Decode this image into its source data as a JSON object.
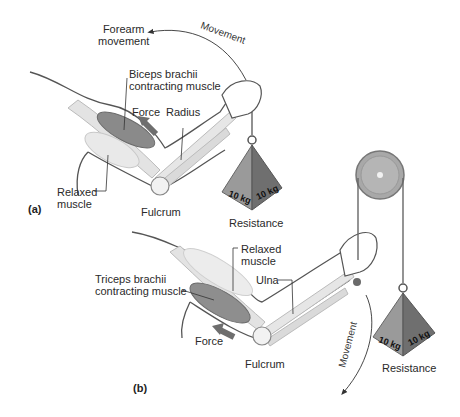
{
  "panel_a": {
    "tag": "(a)",
    "labels": {
      "forearm_movement_1": "Forearm",
      "forearm_movement_2": "movement",
      "movement": "Movement",
      "biceps_1": "Biceps brachii",
      "biceps_2": "contracting muscle",
      "force": "Force",
      "radius": "Radius",
      "relaxed_1": "Relaxed",
      "relaxed_2": "muscle",
      "fulcrum": "Fulcrum",
      "resistance": "Resistance",
      "weight_left": "10 kg",
      "weight_right": "10 kg"
    }
  },
  "panel_b": {
    "tag": "(b)",
    "labels": {
      "relaxed_1": "Relaxed",
      "relaxed_2": "muscle",
      "ulna": "Ulna",
      "triceps_1": "Triceps brachii",
      "triceps_2": "contracting muscle",
      "force": "Force",
      "fulcrum": "Fulcrum",
      "movement": "Movement",
      "resistance": "Resistance",
      "weight_left": "10 kg",
      "weight_right": "10 kg"
    }
  },
  "colors": {
    "skin_outline": "#555555",
    "bone": "#dcdcdc",
    "muscle_contracting": "#8a8a8a",
    "arrow": "#6e6e6e",
    "weight_light": "#9a9a9a",
    "weight_dark": "#6f6f6f",
    "pulley": "#a8a8a8"
  }
}
